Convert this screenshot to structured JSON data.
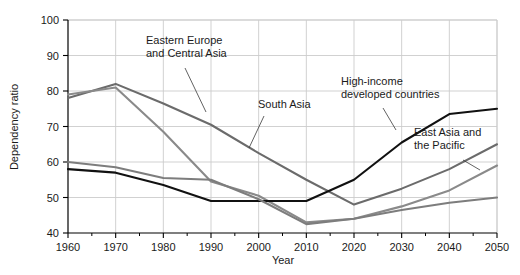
{
  "chart_data": {
    "type": "line",
    "title": "",
    "xlabel": "Year",
    "ylabel": "Dependency ratio",
    "xlim": [
      1960,
      2050
    ],
    "ylim": [
      40,
      100
    ],
    "xticks": [
      1960,
      1970,
      1980,
      1990,
      2000,
      2010,
      2020,
      2030,
      2040,
      2050
    ],
    "yticks": [
      40,
      50,
      60,
      70,
      80,
      90,
      100
    ],
    "x": [
      1960,
      1970,
      1980,
      1990,
      2000,
      2010,
      2020,
      2030,
      2040,
      2050
    ],
    "grid": true,
    "legend_position": "inline-annotations",
    "series": [
      {
        "name": "Eastern Europe and Central Asia",
        "color": "#6b6b6b",
        "values": [
          78.0,
          82.0,
          76.5,
          70.5,
          62.5,
          55.0,
          48.0,
          52.5,
          58.0,
          65.0
        ]
      },
      {
        "name": "South Asia",
        "color": "#8a8a8a",
        "values": [
          79.0,
          81.0,
          68.5,
          54.5,
          50.5,
          43.0,
          44.0,
          47.5,
          52.0,
          59.0
        ]
      },
      {
        "name": "High-income developed countries",
        "color": "#111111",
        "values": [
          58.0,
          57.0,
          53.5,
          49.0,
          49.0,
          49.0,
          55.0,
          65.5,
          73.5,
          75.0
        ]
      },
      {
        "name": "East Asia and the Pacific",
        "color": "#7d7d7d",
        "values": [
          60.0,
          58.5,
          55.5,
          55.0,
          49.5,
          42.5,
          44.0,
          46.5,
          48.5,
          50.0
        ]
      }
    ],
    "annotations": [
      {
        "text_lines": [
          "Eastern Europe",
          "and Central Asia"
        ],
        "label_x": 146,
        "label_y": 44,
        "leader": {
          "x1": 185,
          "y1": 68,
          "x2": 206,
          "y2": 112
        }
      },
      {
        "text_lines": [
          "South Asia"
        ],
        "label_x": 258,
        "label_y": 108,
        "leader": {
          "x1": 264,
          "y1": 116,
          "x2": 249,
          "y2": 148
        }
      },
      {
        "text_lines": [
          "High-income",
          "developed countries"
        ],
        "label_x": 341,
        "label_y": 85,
        "leader": {
          "x1": 383,
          "y1": 108,
          "x2": 396,
          "y2": 130
        }
      },
      {
        "text_lines": [
          "East Asia and",
          "the Pacific"
        ],
        "label_x": 414,
        "label_y": 136,
        "leader": {
          "x1": 463,
          "y1": 160,
          "x2": 480,
          "y2": 170
        }
      }
    ]
  },
  "axes": {
    "y_label": "Dependency ratio",
    "x_label": "Year",
    "y_tick_labels": [
      "100",
      "90",
      "80",
      "70",
      "60",
      "50",
      "40"
    ],
    "x_tick_labels": [
      "1960",
      "1970",
      "1980",
      "1990",
      "2000",
      "2010",
      "2020",
      "2030",
      "2040",
      "2050"
    ]
  },
  "colors": {
    "axis": "#000000",
    "grid": "#cccccc",
    "background": "#ffffff",
    "text": "#1a1a1a"
  }
}
